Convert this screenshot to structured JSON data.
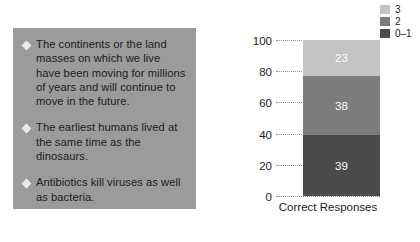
{
  "statements": {
    "bullet_icon": "diamond-bullet",
    "panel_color": "#9b9b9b",
    "items": [
      {
        "text": "The continents or the land masses on which we live have been moving for millions of years and will continue to move in the future."
      },
      {
        "text": "The earliest humans lived at the same time as the dinosaurs."
      },
      {
        "text": "Antibiotics kill viruses as well as bacteria."
      }
    ]
  },
  "chart_data": {
    "type": "bar",
    "stacked": true,
    "title": "",
    "xlabel": "Correct Responses",
    "ylabel": "",
    "categories": [
      "Correct Responses"
    ],
    "ylim": [
      0,
      100
    ],
    "yticks": [
      0,
      20,
      40,
      60,
      80,
      100
    ],
    "ytick_labels": [
      "0",
      "20",
      "40",
      "60",
      "80",
      "100"
    ],
    "grid": "horizontal-dotted",
    "legend_position": "top-right",
    "series": [
      {
        "name": "0–1",
        "values": [
          39
        ],
        "color": "#4b4b4b",
        "label": "39"
      },
      {
        "name": "2",
        "values": [
          38
        ],
        "color": "#7c7c7c",
        "label": "38"
      },
      {
        "name": "3",
        "values": [
          23
        ],
        "color": "#c3c3c3",
        "label": "23"
      }
    ],
    "legend": [
      {
        "label": "3",
        "color": "#c3c3c3"
      },
      {
        "label": "2",
        "color": "#7c7c7c"
      },
      {
        "label": "0–1",
        "color": "#4b4b4b"
      }
    ]
  }
}
